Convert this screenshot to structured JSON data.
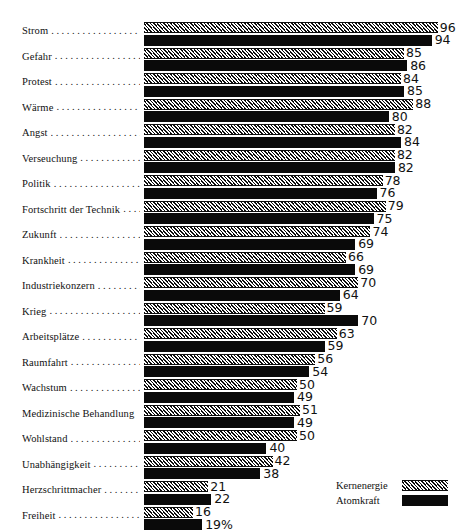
{
  "chart_data": {
    "type": "bar",
    "title": "",
    "subtitle": "",
    "xlabel": "",
    "ylabel": "",
    "orientation": "horizontal",
    "grid": false,
    "legend_position": "bottom-right",
    "xlim": [
      0,
      100
    ],
    "value_suffix": "%",
    "categories": [
      "Strom",
      "Gefahr",
      "Protest",
      "Wärme",
      "Angst",
      "Verseuchung",
      "Politik",
      "Fortschritt der Technik",
      "Zukunft",
      "Krankheit",
      "Industriekonzern",
      "Krieg",
      "Arbeitsplätze",
      "Raumfahrt",
      "Wachstum",
      "Medizinische Behandlung",
      "Wohlstand",
      "Unabhängigkeit",
      "Herzschrittmacher",
      "Freiheit"
    ],
    "series": [
      {
        "name": "Kernenergie",
        "pattern": "hatched",
        "values": [
          96,
          85,
          84,
          88,
          82,
          82,
          78,
          79,
          74,
          66,
          70,
          59,
          63,
          56,
          50,
          51,
          50,
          42,
          21,
          16
        ],
        "value_labels": [
          "96",
          "85",
          "84",
          "88",
          "82",
          "82",
          "78",
          "79",
          "74",
          "66",
          "70",
          "59",
          "63",
          "56",
          "50",
          "51",
          "50",
          "42",
          "21",
          "16"
        ]
      },
      {
        "name": "Atomkraft",
        "pattern": "solid",
        "values": [
          94,
          86,
          85,
          80,
          84,
          82,
          76,
          75,
          69,
          69,
          64,
          70,
          59,
          54,
          49,
          49,
          40,
          38,
          22,
          19
        ],
        "value_labels": [
          "94",
          "86",
          "85",
          "80",
          "84",
          "82",
          "76",
          "75",
          "69",
          "69",
          "64",
          "70",
          "59",
          "54",
          "49",
          "49",
          "40",
          "38",
          "22",
          "19%"
        ]
      }
    ],
    "leaders": [
      true,
      true,
      true,
      true,
      true,
      true,
      true,
      true,
      true,
      true,
      true,
      true,
      true,
      true,
      true,
      false,
      true,
      true,
      true,
      true
    ]
  },
  "legend": {
    "items": [
      {
        "label": "Kernenergie",
        "pattern": "hatched"
      },
      {
        "label": "Atomkraft",
        "pattern": "solid"
      }
    ]
  },
  "colors": {
    "background": "#ffffff",
    "ink": "#0a0a0a",
    "hatch_line": "#0d0d0d",
    "hatch_fill": "#ffffff"
  },
  "scale": {
    "px_per_unit": 3.06,
    "bar_origin_x": 144
  }
}
